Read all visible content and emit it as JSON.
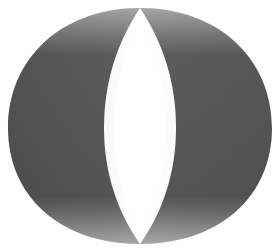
{
  "image": {
    "subject": "grayscale shaded ring band",
    "description": "3D cylinder ring viewed at an angle, dark gray body with lighter bands at top and bottom and a white lens-shaped opening in the center",
    "colors": {
      "background": "#ffffff",
      "body": "#5a5a5a",
      "body_dark": "#4e4e4e",
      "band_mid": "#6e6e6e",
      "band_light": "#8a8a8a",
      "band_lightest": "#a5a5a5",
      "opening": "#ffffff"
    }
  }
}
